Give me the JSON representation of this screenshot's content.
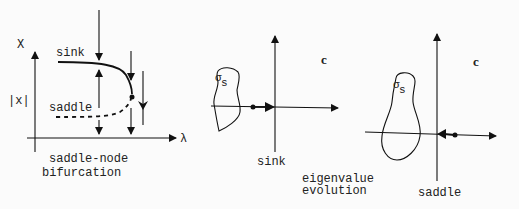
{
  "panel_bifurcation": {
    "y_axis_label": "X",
    "abs_label": "|x|",
    "x_axis_label": "λ",
    "upper_branch_label": "sink",
    "lower_branch_label": "saddle",
    "caption_line1": "saddle-node",
    "caption_line2": "bifurcation"
  },
  "panel_sink": {
    "plane_label": "c",
    "region_label_main": "σ",
    "region_label_sub": "s",
    "caption": "sink"
  },
  "center_caption": {
    "line1": "eigenvalue",
    "line2": "evolution"
  },
  "panel_saddle": {
    "plane_label": "c",
    "region_label_main": "σ",
    "region_label_sub": "s",
    "caption": "saddle"
  }
}
